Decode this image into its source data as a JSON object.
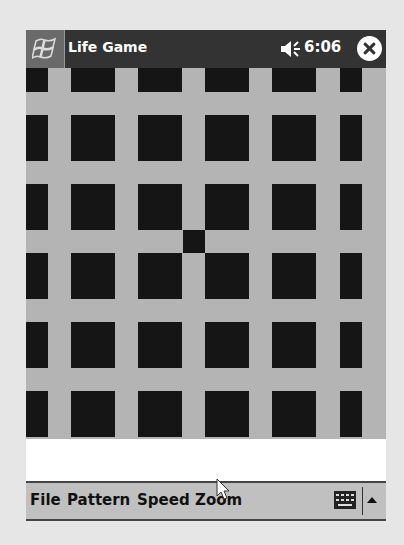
{
  "titlebar": {
    "app_title": "Life Game",
    "clock": "6:06",
    "start_icon": "windows-flag-icon",
    "volume_icon": "speaker-icon",
    "close_icon": "close-x-icon"
  },
  "board": {
    "cell_color": "#151515",
    "background": "#b4b4b4",
    "columns_x": [
      [
        0,
        22
      ],
      [
        45,
        89
      ],
      [
        112,
        156
      ],
      [
        179,
        223
      ],
      [
        246,
        290
      ],
      [
        314,
        336
      ]
    ],
    "rows_y": [
      [
        0,
        24
      ],
      [
        47,
        93
      ],
      [
        116,
        162
      ],
      [
        185,
        231
      ],
      [
        254,
        300
      ],
      [
        323,
        369
      ]
    ],
    "extra_cells": [
      {
        "x": 157,
        "y": 162,
        "w": 22,
        "h": 23
      }
    ]
  },
  "menubar": {
    "items": [
      {
        "label": "File"
      },
      {
        "label": "Pattern"
      },
      {
        "label": "Speed"
      },
      {
        "label": "Zoom"
      }
    ],
    "keyboard_icon": "keyboard-icon",
    "sip_arrow_icon": "triangle-up-icon"
  }
}
